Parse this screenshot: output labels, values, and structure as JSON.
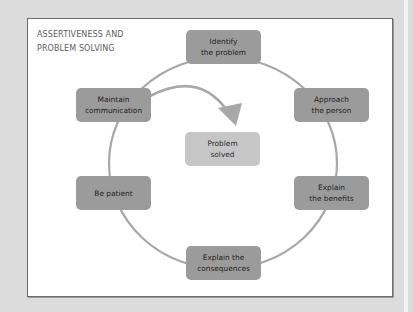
{
  "diagram": {
    "title_lines": [
      "ASSERTIVENESS AND",
      "PROBLEM SOLVING"
    ],
    "center": {
      "lines": [
        "Problem",
        "solved"
      ]
    },
    "steps": [
      {
        "id": "identify",
        "lines": [
          "Identify",
          "the problem"
        ]
      },
      {
        "id": "approach",
        "lines": [
          "Approach",
          "the person"
        ]
      },
      {
        "id": "benefits",
        "lines": [
          "Explain",
          "the benefits"
        ]
      },
      {
        "id": "consequences",
        "lines": [
          "Explain the",
          "consequences"
        ]
      },
      {
        "id": "patient",
        "lines": [
          "Be patient"
        ]
      },
      {
        "id": "maintain",
        "lines": [
          "Maintain",
          "communication"
        ]
      }
    ],
    "colors": {
      "step_box": "#9b9b9b",
      "center_box": "#c6c6c6",
      "cycle_line": "#a8a8a8",
      "panel_border": "#6a6a6a",
      "background": "#dcdcdc"
    }
  }
}
